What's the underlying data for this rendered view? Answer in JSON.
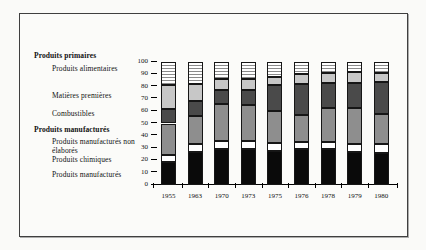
{
  "legend": {
    "group1": {
      "label": "Produits primaires",
      "items": [
        "Produits alimentaires",
        "Matières premières",
        "Combustibles"
      ]
    },
    "group2": {
      "label": "Produits manufacturés",
      "items": [
        "Produits manufacturés non élaborés",
        "Produits chimiques",
        "Produits manufacturés"
      ]
    }
  },
  "chart_data": {
    "type": "bar",
    "stacked": true,
    "title": "",
    "xlabel": "",
    "ylabel": "",
    "ylim": [
      0,
      100
    ],
    "yticks": [
      0,
      10,
      20,
      30,
      40,
      50,
      60,
      70,
      80,
      90,
      100
    ],
    "grid": false,
    "legend_position": "left",
    "categories": [
      "1955",
      "1963",
      "1970",
      "1973",
      "1975",
      "1976",
      "1978",
      "1979",
      "1980"
    ],
    "stack_order": "bottom-to-top",
    "series": [
      {
        "name": "Produits manufacturés",
        "color": "#0a0a0a",
        "pattern": "solid",
        "values": [
          19,
          27,
          29,
          29,
          28,
          29,
          29,
          27,
          26
        ]
      },
      {
        "name": "Produits chimiques",
        "color": "#ffffff",
        "pattern": "solid",
        "values": [
          5,
          6,
          7,
          7,
          6,
          6,
          6,
          6,
          7
        ]
      },
      {
        "name": "Produits manufacturés non élaborés",
        "color": "#8e8e8e",
        "pattern": "solid",
        "values": [
          26,
          23,
          30,
          29,
          26,
          22,
          28,
          30,
          25
        ]
      },
      {
        "name": "Combustibles",
        "color": "#4a4a4a",
        "pattern": "solid",
        "values": [
          12,
          12,
          11,
          12,
          21,
          25,
          20,
          20,
          26
        ]
      },
      {
        "name": "Matières premières",
        "color": "#c7c7c7",
        "pattern": "solid",
        "values": [
          19,
          14,
          9,
          9,
          7,
          8,
          8,
          9,
          7
        ]
      },
      {
        "name": "Produits alimentaires",
        "color": "#8a8a8a",
        "pattern": "hlines",
        "pattern_bg": "#ffffff",
        "values": [
          19,
          18,
          14,
          14,
          12,
          10,
          9,
          8,
          9
        ]
      }
    ]
  }
}
